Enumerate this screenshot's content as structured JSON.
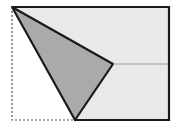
{
  "diagram": {
    "type": "folded-rectangle-geometry",
    "colors": {
      "background": "#ffffff",
      "rect_fill": "#e9e9e9",
      "triangle_fill": "#aaaaaa",
      "stroke": "#1a1a1a",
      "fold_line": "#8a8a8a",
      "dashed": "#555555"
    },
    "points": {
      "top_left": [
        12,
        7
      ],
      "top_right": [
        169,
        7
      ],
      "bottom_right": [
        169,
        120
      ],
      "bottom_left": [
        12,
        120
      ],
      "fold_bottom": [
        75,
        120
      ],
      "fold_right": [
        113,
        64
      ],
      "right_edge_mid": [
        169,
        64
      ]
    }
  }
}
